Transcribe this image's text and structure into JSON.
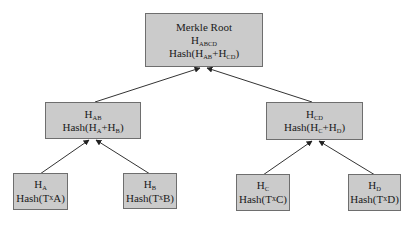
{
  "diagram": {
    "type": "merkle-tree",
    "colors": {
      "node_fill": "#cbcbcb",
      "node_border": "#6e6e6e",
      "edge": "#333333",
      "background": "#ffffff"
    },
    "root": {
      "title": "Merkle Root",
      "symbol": "H",
      "symbol_sub": "ABCD",
      "formula_prefix": "Hash(H",
      "formula_sub1": "AB",
      "formula_mid": "+H",
      "formula_sub2": "CD",
      "formula_suffix": ")"
    },
    "level1": [
      {
        "id": "HAB",
        "symbol": "H",
        "symbol_sub": "AB",
        "formula_prefix": "Hash(H",
        "formula_sub1": "A",
        "formula_mid": "+H",
        "formula_sub2": "B",
        "formula_suffix": ")"
      },
      {
        "id": "HCD",
        "symbol": "H",
        "symbol_sub": "CD",
        "formula_prefix": "Hash(H",
        "formula_sub1": "C",
        "formula_mid": "+H",
        "formula_sub2": "D",
        "formula_suffix": ")"
      }
    ],
    "leaves": [
      {
        "id": "HA",
        "symbol": "H",
        "symbol_sub": "A",
        "formula_prefix": "Hash(T",
        "formula_x": "x",
        "formula_suffix": "A)"
      },
      {
        "id": "HB",
        "symbol": "H",
        "symbol_sub": "B",
        "formula_prefix": "Hash(T",
        "formula_x": "x",
        "formula_suffix": "B)"
      },
      {
        "id": "HC",
        "symbol": "H",
        "symbol_sub": "C",
        "formula_prefix": "Hash(T",
        "formula_x": "x",
        "formula_suffix": "C)"
      },
      {
        "id": "HD",
        "symbol": "H",
        "symbol_sub": "D",
        "formula_prefix": "Hash(T",
        "formula_x": "x",
        "formula_suffix": "D)"
      }
    ],
    "edges": [
      {
        "from": "HAB",
        "to": "root"
      },
      {
        "from": "HCD",
        "to": "root"
      },
      {
        "from": "HA",
        "to": "HAB"
      },
      {
        "from": "HB",
        "to": "HAB"
      },
      {
        "from": "HC",
        "to": "HCD"
      },
      {
        "from": "HD",
        "to": "HCD"
      }
    ]
  }
}
